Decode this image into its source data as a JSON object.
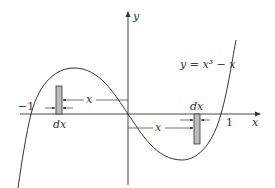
{
  "figure": {
    "equation": "y = x³ − x",
    "axes": {
      "x_label": "x",
      "y_label": "y"
    },
    "ticks": {
      "neg_one": "−1",
      "one": "1"
    },
    "left_strip": {
      "width_label": "dx",
      "distance_label": "x"
    },
    "right_strip": {
      "width_label": "dx",
      "distance_label": "x"
    }
  },
  "colors": {
    "line": "#333333",
    "strip_fill": "#bbbbbb",
    "background": "#ffffff"
  }
}
